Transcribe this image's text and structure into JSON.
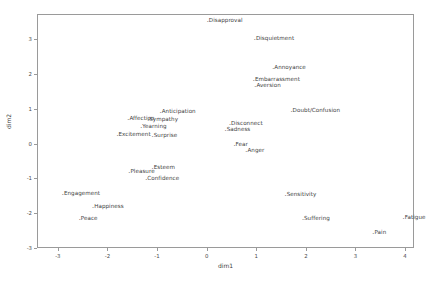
{
  "chart_data": {
    "type": "scatter",
    "title": "",
    "xlabel": "dim1",
    "ylabel": "dim2",
    "xlim": [
      -3.42,
      4.18
    ],
    "ylim": [
      -3.0,
      3.72
    ],
    "xticks": [
      "-3",
      "-2",
      "-1",
      "0",
      "1",
      "2",
      "3",
      "4"
    ],
    "xtickvalues": [
      -3,
      -2,
      -1,
      0,
      1,
      2,
      3,
      4
    ],
    "yticks": [
      "3",
      "2",
      "1",
      "0",
      "-1",
      "-2",
      "-3"
    ],
    "ytickvalues": [
      3,
      2,
      1,
      0,
      -1,
      -2,
      -3
    ],
    "grid": false,
    "legend": false,
    "marker": ".",
    "points": [
      {
        "label": "Disapproval",
        "x": -0.02,
        "y": 3.58
      },
      {
        "label": "Disquietment",
        "x": 0.93,
        "y": 3.05
      },
      {
        "label": "Annoyance",
        "x": 1.3,
        "y": 2.22
      },
      {
        "label": "Embarrassment",
        "x": 0.91,
        "y": 1.88
      },
      {
        "label": "Aversion",
        "x": 0.94,
        "y": 1.7
      },
      {
        "label": "Doubt/Confusion",
        "x": 1.67,
        "y": 1.0
      },
      {
        "label": "Anticipation",
        "x": -0.97,
        "y": 0.95
      },
      {
        "label": "Affection",
        "x": -1.62,
        "y": 0.76
      },
      {
        "label": "Sympathy",
        "x": -1.22,
        "y": 0.74
      },
      {
        "label": "Disconnect",
        "x": 0.43,
        "y": 0.63
      },
      {
        "label": "Yearning",
        "x": -1.36,
        "y": 0.52
      },
      {
        "label": "Sadness",
        "x": 0.34,
        "y": 0.45
      },
      {
        "label": "Excitement",
        "x": -1.84,
        "y": 0.3
      },
      {
        "label": "Surprise",
        "x": -1.13,
        "y": 0.26
      },
      {
        "label": "Fear",
        "x": 0.52,
        "y": 0.02
      },
      {
        "label": "Anger",
        "x": 0.76,
        "y": -0.15
      },
      {
        "label": "Esteem",
        "x": -1.13,
        "y": -0.64
      },
      {
        "label": "Pleasure",
        "x": -1.6,
        "y": -0.76
      },
      {
        "label": "Confidence",
        "x": -1.26,
        "y": -0.96
      },
      {
        "label": "Engagement",
        "x": -2.94,
        "y": -1.4
      },
      {
        "label": "Sensitivity",
        "x": 1.55,
        "y": -1.41
      },
      {
        "label": "Happiness",
        "x": -2.33,
        "y": -1.76
      },
      {
        "label": "Peace",
        "x": -2.6,
        "y": -2.1
      },
      {
        "label": "Suffering",
        "x": 1.9,
        "y": -2.1
      },
      {
        "label": "Fatigue",
        "x": 3.93,
        "y": -2.08
      },
      {
        "label": "Pain",
        "x": 3.32,
        "y": -2.52
      }
    ]
  },
  "axes": {
    "x_axis_label": "dim1",
    "y_axis_label": "dim2"
  },
  "style": {
    "frame_color": "#9a9a9a",
    "text_color": "#3d3d3d",
    "background": "#ffffff"
  }
}
